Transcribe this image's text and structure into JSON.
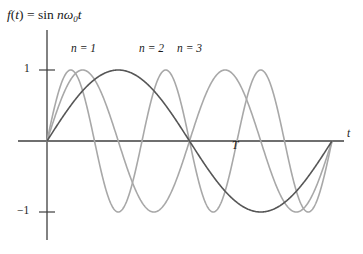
{
  "figure": {
    "title_parts": {
      "f": "f",
      "open": "(",
      "t1": "t",
      "close": ")",
      "equals": " = ",
      "sin": "sin",
      "n": " n",
      "omega": "ω",
      "sub0": "0",
      "t2": "t"
    },
    "background_color": "#ffffff",
    "axis_color": "#3f3f3f"
  },
  "axes": {
    "x_label": "t",
    "y_label": "",
    "y_ticks": [
      {
        "label": "1",
        "value": 1
      },
      {
        "label": "−1",
        "value": -1
      }
    ],
    "x_annotations": [
      {
        "label": "T",
        "value": 0.635
      }
    ],
    "origin_px": {
      "x": 47,
      "y": 141
    },
    "unit_px_y": 71,
    "x_start_px": 47,
    "x_end_px": 332,
    "x_axis_left_px": 18,
    "x_axis_right_px": 344,
    "y_axis_top_px": 30,
    "y_axis_bottom_px": 240
  },
  "legend": {
    "items": [
      {
        "label": "n = 1",
        "n": 1,
        "color": "#565656"
      },
      {
        "label": "n = 2",
        "n": 2,
        "color": "#a8a8a8"
      },
      {
        "label": "n = 3",
        "n": 3,
        "color": "#a8a8a8"
      }
    ]
  },
  "chart_data": {
    "type": "line",
    "xlabel": "t",
    "ylabel": "",
    "xlim": [
      0,
      1
    ],
    "ylim": [
      -1.35,
      1.35
    ],
    "grid": false,
    "legend_position": "above-plot-inline",
    "x_tick_labels": [
      "T"
    ],
    "x_tick_values": [
      0.635
    ],
    "y_tick_labels": [
      "1",
      "−1"
    ],
    "y_tick_values": [
      1,
      -1
    ],
    "function": "f(t) = sin(n * omega_0 * t)",
    "note": "Harmonics of a sine wave: n = 1 completes one half-cycle by T and one full cycle across the plotted window; n = 2 and n = 3 are the second and third harmonics with 2x and 3x the frequency.",
    "series": [
      {
        "name": "n = 1",
        "n": 1,
        "color": "#565656",
        "line_width": 1.6,
        "amplitude": 1,
        "cycles_over_window": 1,
        "x": [
          0,
          0.0625,
          0.125,
          0.1875,
          0.25,
          0.3125,
          0.375,
          0.4375,
          0.5,
          0.5625,
          0.625,
          0.6875,
          0.75,
          0.8125,
          0.875,
          0.9375,
          1
        ],
        "y": [
          0,
          0.383,
          0.707,
          0.924,
          1,
          0.924,
          0.707,
          0.383,
          0,
          -0.383,
          -0.707,
          -0.924,
          -1,
          -0.924,
          -0.707,
          -0.383,
          0
        ]
      },
      {
        "name": "n = 2",
        "n": 2,
        "color": "#a8a8a8",
        "line_width": 1.6,
        "amplitude": 1,
        "cycles_over_window": 2,
        "x": [
          0,
          0.0625,
          0.125,
          0.1875,
          0.25,
          0.3125,
          0.375,
          0.4375,
          0.5,
          0.5625,
          0.625,
          0.6875,
          0.75,
          0.8125,
          0.875,
          0.9375,
          1
        ],
        "y": [
          0,
          0.707,
          1,
          0.707,
          0,
          -0.707,
          -1,
          -0.707,
          0,
          0.707,
          1,
          0.707,
          0,
          -0.707,
          -1,
          -0.707,
          0
        ]
      },
      {
        "name": "n = 3",
        "n": 3,
        "color": "#a8a8a8",
        "line_width": 1.6,
        "amplitude": 1,
        "cycles_over_window": 3,
        "x": [
          0,
          0.0625,
          0.125,
          0.1875,
          0.25,
          0.3125,
          0.375,
          0.4375,
          0.5,
          0.5625,
          0.625,
          0.6875,
          0.75,
          0.8125,
          0.875,
          0.9375,
          1
        ],
        "y": [
          0,
          0.924,
          0.707,
          -0.383,
          -1,
          -0.383,
          0.707,
          0.924,
          0,
          -0.924,
          -0.707,
          0.383,
          1,
          0.383,
          -0.707,
          -0.924,
          0
        ]
      }
    ]
  }
}
